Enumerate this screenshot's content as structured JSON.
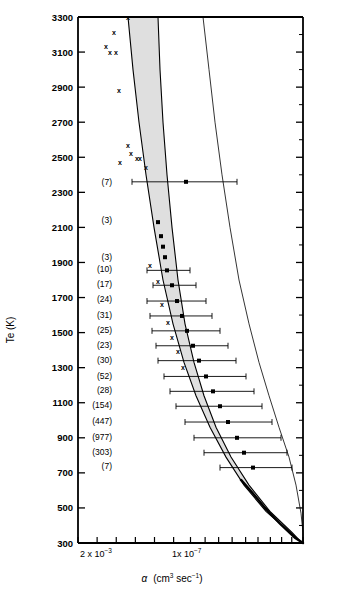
{
  "figure": {
    "y_axis_title": "Te  (K)",
    "x_axis_title_symbol": "α",
    "x_axis_title_units_main": "(cm",
    "x_axis_title_units_sup1": "3",
    "x_axis_title_units_mid": " sec",
    "x_axis_title_sup2": "−1",
    "x_axis_title_close": ")",
    "x_tick_left_mantissa": "2 x 10",
    "x_tick_left_exp": "−3",
    "x_tick_right_mantissa": "1x 10",
    "x_tick_right_exp": "−7"
  },
  "chart_data": {
    "type": "line",
    "title": "",
    "xlabel": "α  (cm3 sec-1)",
    "ylabel": "Te  (K)",
    "x_scale": "log-decreasing",
    "xlim": [
      0.002,
      2e-09
    ],
    "ylim": [
      300,
      3300
    ],
    "grid": false,
    "legend": "none",
    "y_ticks": [
      300,
      500,
      700,
      900,
      1100,
      1300,
      1500,
      1700,
      1900,
      2100,
      2300,
      2500,
      2700,
      2900,
      3100,
      3300
    ],
    "y_tick_labels": [
      "300",
      "500",
      "700",
      "900",
      "1100",
      "1300",
      "1500",
      "1700",
      "1900",
      "2100",
      "2300",
      "2500",
      "2700",
      "2900",
      "3100",
      "3300"
    ],
    "y_minor_ticks": [
      400,
      600,
      800,
      1000,
      1200,
      1400,
      1600,
      1800,
      2000,
      2200,
      2400,
      2600,
      2800,
      3000,
      3200
    ],
    "x_tick_labels": [
      {
        "value": 0.002,
        "label": "2 x 10-3"
      },
      {
        "value": 1e-07,
        "label": "1x10-7"
      }
    ],
    "sample_counts": [
      {
        "label": "(7)",
        "te": 2360
      },
      {
        "label": "(3)",
        "te": 2140
      },
      {
        "label": "(3)",
        "te": 1930
      },
      {
        "label": "(10)",
        "te": 1860
      },
      {
        "label": "(17)",
        "te": 1775
      },
      {
        "label": "(24)",
        "te": 1690
      },
      {
        "label": "(31)",
        "te": 1600
      },
      {
        "label": "(25)",
        "te": 1515
      },
      {
        "label": "(23)",
        "te": 1430
      },
      {
        "label": "(30)",
        "te": 1345
      },
      {
        "label": "(52)",
        "te": 1255
      },
      {
        "label": "(28)",
        "te": 1170
      },
      {
        "label": "(154)",
        "te": 1085
      },
      {
        "label": "(447)",
        "te": 995
      },
      {
        "label": "(977)",
        "te": 905
      },
      {
        "label": "(303)",
        "te": 820
      },
      {
        "label": "(7)",
        "te": 740
      }
    ],
    "series": [
      {
        "name": "band-upper-bound",
        "style": "solid-thin",
        "points": [
          {
            "x_px": 128,
            "te": 3300
          },
          {
            "x_px": 133,
            "te": 3000
          },
          {
            "x_px": 139,
            "te": 2700
          },
          {
            "x_px": 146,
            "te": 2400
          },
          {
            "x_px": 154,
            "te": 2100
          },
          {
            "x_px": 163,
            "te": 1800
          },
          {
            "x_px": 173,
            "te": 1550
          },
          {
            "x_px": 184,
            "te": 1330
          },
          {
            "x_px": 196,
            "te": 1140
          },
          {
            "x_px": 210,
            "te": 960
          },
          {
            "x_px": 226,
            "te": 790
          },
          {
            "x_px": 244,
            "te": 630
          },
          {
            "x_px": 266,
            "te": 480
          },
          {
            "x_px": 290,
            "te": 360
          },
          {
            "x_px": 302,
            "te": 300
          }
        ]
      },
      {
        "name": "band-lower-bound",
        "style": "solid-thin",
        "points": [
          {
            "x_px": 158,
            "te": 3300
          },
          {
            "x_px": 160,
            "te": 3000
          },
          {
            "x_px": 163,
            "te": 2700
          },
          {
            "x_px": 167,
            "te": 2400
          },
          {
            "x_px": 172,
            "te": 2100
          },
          {
            "x_px": 178,
            "te": 1800
          },
          {
            "x_px": 185,
            "te": 1550
          },
          {
            "x_px": 194,
            "te": 1330
          },
          {
            "x_px": 204,
            "te": 1140
          },
          {
            "x_px": 216,
            "te": 960
          },
          {
            "x_px": 231,
            "te": 790
          },
          {
            "x_px": 249,
            "te": 630
          },
          {
            "x_px": 270,
            "te": 480
          },
          {
            "x_px": 292,
            "te": 360
          },
          {
            "x_px": 302,
            "te": 300
          }
        ]
      },
      {
        "name": "comparison-curve",
        "style": "solid-thin-right",
        "points": [
          {
            "x_px": 203,
            "te": 3300
          },
          {
            "x_px": 209,
            "te": 3000
          },
          {
            "x_px": 215,
            "te": 2700
          },
          {
            "x_px": 222,
            "te": 2400
          },
          {
            "x_px": 230,
            "te": 2100
          },
          {
            "x_px": 239,
            "te": 1800
          },
          {
            "x_px": 249,
            "te": 1550
          },
          {
            "x_px": 259,
            "te": 1330
          },
          {
            "x_px": 269,
            "te": 1140
          },
          {
            "x_px": 279,
            "te": 960
          },
          {
            "x_px": 289,
            "te": 790
          },
          {
            "x_px": 296,
            "te": 630
          },
          {
            "x_px": 301,
            "te": 470
          },
          {
            "x_px": 303,
            "te": 360
          },
          {
            "x_px": 303,
            "te": 300
          }
        ]
      },
      {
        "name": "thick-lower-tail",
        "style": "solid-thick",
        "points": [
          {
            "x_px": 241,
            "te": 660
          },
          {
            "x_px": 252,
            "te": 590
          },
          {
            "x_px": 265,
            "te": 500
          },
          {
            "x_px": 280,
            "te": 410
          },
          {
            "x_px": 295,
            "te": 330
          },
          {
            "x_px": 303,
            "te": 300
          }
        ]
      }
    ],
    "scatter_x_markers": [
      {
        "x_px": 128,
        "te": 3300
      },
      {
        "x_px": 114,
        "te": 3210
      },
      {
        "x_px": 106,
        "te": 3130
      },
      {
        "x_px": 110,
        "te": 3095
      },
      {
        "x_px": 116,
        "te": 3095
      },
      {
        "x_px": 119,
        "te": 2880
      },
      {
        "x_px": 128,
        "te": 2565
      },
      {
        "x_px": 131,
        "te": 2520
      },
      {
        "x_px": 120,
        "te": 2470
      },
      {
        "x_px": 137,
        "te": 2495
      },
      {
        "x_px": 140,
        "te": 2495
      },
      {
        "x_px": 146,
        "te": 2440
      },
      {
        "x_px": 150,
        "te": 1880
      },
      {
        "x_px": 158,
        "te": 1790
      },
      {
        "x_px": 162,
        "te": 1660
      },
      {
        "x_px": 168,
        "te": 1555
      },
      {
        "x_px": 172,
        "te": 1470
      },
      {
        "x_px": 178,
        "te": 1390
      },
      {
        "x_px": 183,
        "te": 1300
      }
    ],
    "data_points_with_errorbars": [
      {
        "te": 2360,
        "x_px": 186,
        "err_lo_px": 132,
        "err_hi_px": 237
      },
      {
        "te": 2130,
        "x_px": 158,
        "err_lo_px": 158,
        "err_hi_px": 158
      },
      {
        "te": 1930,
        "x_px": 165,
        "err_lo_px": 165,
        "err_hi_px": 165
      },
      {
        "te": 1855,
        "x_px": 167,
        "err_lo_px": 147,
        "err_hi_px": 190
      },
      {
        "te": 1770,
        "x_px": 172,
        "err_lo_px": 153,
        "err_hi_px": 196
      },
      {
        "te": 1680,
        "x_px": 177,
        "err_lo_px": 147,
        "err_hi_px": 206
      },
      {
        "te": 1595,
        "x_px": 182,
        "err_lo_px": 150,
        "err_hi_px": 212
      },
      {
        "te": 1510,
        "x_px": 187,
        "err_lo_px": 152,
        "err_hi_px": 220
      },
      {
        "te": 1425,
        "x_px": 193,
        "err_lo_px": 156,
        "err_hi_px": 228
      },
      {
        "te": 1340,
        "x_px": 199,
        "err_lo_px": 158,
        "err_hi_px": 236
      },
      {
        "te": 1250,
        "x_px": 206,
        "err_lo_px": 164,
        "err_hi_px": 246
      },
      {
        "te": 1165,
        "x_px": 213,
        "err_lo_px": 170,
        "err_hi_px": 254
      },
      {
        "te": 1080,
        "x_px": 220,
        "err_lo_px": 176,
        "err_hi_px": 262
      },
      {
        "te": 990,
        "x_px": 228,
        "err_lo_px": 185,
        "err_hi_px": 272
      },
      {
        "te": 900,
        "x_px": 237,
        "err_lo_px": 194,
        "err_hi_px": 281
      },
      {
        "te": 815,
        "x_px": 244,
        "err_lo_px": 204,
        "err_hi_px": 287
      },
      {
        "te": 730,
        "x_px": 253,
        "err_lo_px": 220,
        "err_hi_px": 292
      },
      {
        "te": 2050,
        "x_px": 161,
        "err_lo_px": 161,
        "err_hi_px": 161
      },
      {
        "te": 1990,
        "x_px": 163,
        "err_lo_px": 163,
        "err_hi_px": 163
      }
    ]
  }
}
